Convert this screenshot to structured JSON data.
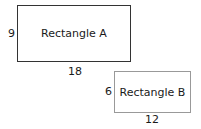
{
  "rectangles": [
    {
      "name": "Rectangle A",
      "height_label": "9",
      "width_label": "18"
    },
    {
      "name": "Rectangle B",
      "height_label": "6",
      "width_label": "12"
    }
  ]
}
